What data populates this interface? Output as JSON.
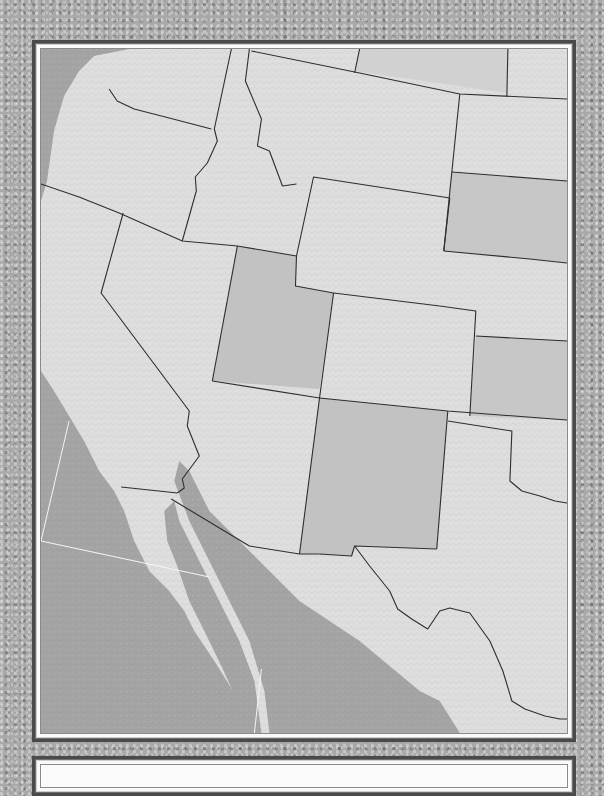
{
  "map": {
    "type": "shaded-relief state outline map",
    "region": "Western United States and northern Mexico",
    "labels": [],
    "colors": {
      "water": "#a4a4a4",
      "land_light": "#dedede",
      "land_medium": "#cfcfcf",
      "land_dark": "#bdbdbd",
      "border": "#2e2e2e",
      "graticule": "#f4f4f4",
      "frame_dark": "#4a4a4a",
      "frame_light": "#fafafa"
    },
    "states": [
      {
        "name": "Washington",
        "shade": "light"
      },
      {
        "name": "Oregon",
        "shade": "light"
      },
      {
        "name": "California",
        "shade": "light"
      },
      {
        "name": "Idaho",
        "shade": "light"
      },
      {
        "name": "Nevada",
        "shade": "light"
      },
      {
        "name": "Montana",
        "shade": "light"
      },
      {
        "name": "Wyoming",
        "shade": "light"
      },
      {
        "name": "Utah",
        "shade": "dark"
      },
      {
        "name": "Colorado",
        "shade": "light"
      },
      {
        "name": "Arizona",
        "shade": "light"
      },
      {
        "name": "New Mexico",
        "shade": "dark"
      },
      {
        "name": "North Dakota",
        "shade": "medium"
      },
      {
        "name": "South Dakota",
        "shade": "dark"
      },
      {
        "name": "Nebraska",
        "shade": "light"
      },
      {
        "name": "Kansas",
        "shade": "dark"
      },
      {
        "name": "Oklahoma",
        "shade": "light"
      },
      {
        "name": "Texas",
        "shade": "light"
      },
      {
        "name": "Mexico",
        "shade": "light"
      }
    ]
  },
  "info_panel": {
    "text": ""
  }
}
